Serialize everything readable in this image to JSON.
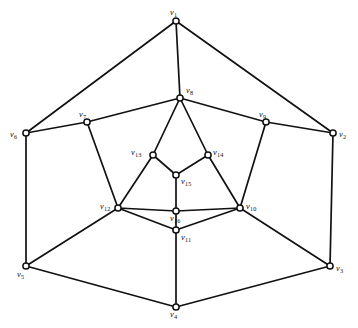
{
  "figure": {
    "background_color": "#ffffff",
    "edge_color": "#111111",
    "node_fill_color": "#ffffff",
    "node_stroke_color": "#111111",
    "width": 358,
    "height": 328
  },
  "chart_data": {
    "type": "diagram",
    "subtype": "undirected-graph",
    "title": "",
    "vertex_count": 16,
    "edge_count": 30,
    "nodes": [
      {
        "id": "v1",
        "label": "v",
        "sub": "1",
        "x": 176,
        "y": 21,
        "label_x": 170,
        "label_y": 8,
        "ring": "outer"
      },
      {
        "id": "v2",
        "label": "v",
        "sub": "2",
        "x": 333,
        "y": 133,
        "label_x": 339,
        "label_y": 130,
        "ring": "outer"
      },
      {
        "id": "v3",
        "label": "v",
        "sub": "3",
        "x": 330,
        "y": 266,
        "label_x": 336,
        "label_y": 264,
        "ring": "outer"
      },
      {
        "id": "v4",
        "label": "v",
        "sub": "4",
        "x": 176,
        "y": 307,
        "label_x": 170,
        "label_y": 310,
        "ring": "outer"
      },
      {
        "id": "v5",
        "label": "v",
        "sub": "5",
        "x": 26,
        "y": 266,
        "label_x": 17,
        "label_y": 270,
        "ring": "outer"
      },
      {
        "id": "v6",
        "label": "v",
        "sub": "6",
        "x": 26,
        "y": 133,
        "label_x": 10,
        "label_y": 130,
        "ring": "outer"
      },
      {
        "id": "v7",
        "label": "v",
        "sub": "7",
        "x": 87,
        "y": 122,
        "label_x": 79,
        "label_y": 110,
        "ring": "middle"
      },
      {
        "id": "v8",
        "label": "v",
        "sub": "8",
        "x": 180,
        "y": 98,
        "label_x": 186,
        "label_y": 86,
        "ring": "middle"
      },
      {
        "id": "v9",
        "label": "v",
        "sub": "9",
        "x": 266,
        "y": 122,
        "label_x": 259,
        "label_y": 110,
        "ring": "middle"
      },
      {
        "id": "v10",
        "label": "v",
        "sub": "10",
        "x": 240,
        "y": 208,
        "label_x": 246,
        "label_y": 202,
        "ring": "middle"
      },
      {
        "id": "v11",
        "label": "v",
        "sub": "11",
        "x": 176,
        "y": 230,
        "label_x": 181,
        "label_y": 233,
        "ring": "middle"
      },
      {
        "id": "v12",
        "label": "v",
        "sub": "12",
        "x": 118,
        "y": 208,
        "label_x": 100,
        "label_y": 202,
        "ring": "middle"
      },
      {
        "id": "v13",
        "label": "v",
        "sub": "13",
        "x": 153,
        "y": 155,
        "label_x": 131,
        "label_y": 148,
        "ring": "inner"
      },
      {
        "id": "v14",
        "label": "v",
        "sub": "14",
        "x": 208,
        "y": 155,
        "label_x": 213,
        "label_y": 148,
        "ring": "inner"
      },
      {
        "id": "v15",
        "label": "v",
        "sub": "15",
        "x": 176,
        "y": 175,
        "label_x": 181,
        "label_y": 177,
        "ring": "inner"
      },
      {
        "id": "v16",
        "label": "v",
        "sub": "16",
        "x": 176,
        "y": 211,
        "label_x": 170,
        "label_y": 214,
        "ring": "inner"
      }
    ],
    "edges": [
      [
        "v1",
        "v6"
      ],
      [
        "v1",
        "v2"
      ],
      [
        "v1",
        "v8"
      ],
      [
        "v2",
        "v3"
      ],
      [
        "v2",
        "v9"
      ],
      [
        "v3",
        "v4"
      ],
      [
        "v3",
        "v10"
      ],
      [
        "v4",
        "v5"
      ],
      [
        "v4",
        "v11"
      ],
      [
        "v5",
        "v6"
      ],
      [
        "v5",
        "v12"
      ],
      [
        "v6",
        "v7"
      ],
      [
        "v7",
        "v8"
      ],
      [
        "v7",
        "v12"
      ],
      [
        "v8",
        "v9"
      ],
      [
        "v8",
        "v13"
      ],
      [
        "v8",
        "v14"
      ],
      [
        "v9",
        "v10"
      ],
      [
        "v10",
        "v11"
      ],
      [
        "v10",
        "v14"
      ],
      [
        "v10",
        "v16"
      ],
      [
        "v11",
        "v12"
      ],
      [
        "v11",
        "v16"
      ],
      [
        "v12",
        "v13"
      ],
      [
        "v12",
        "v16"
      ],
      [
        "v13",
        "v15"
      ],
      [
        "v14",
        "v15"
      ],
      [
        "v15",
        "v16"
      ]
    ]
  }
}
